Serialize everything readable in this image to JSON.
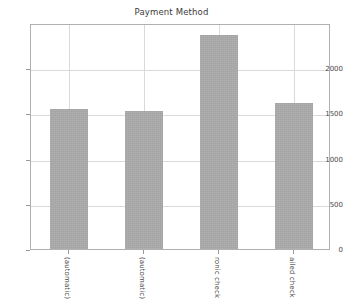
{
  "chart_data": {
    "type": "bar",
    "title": "Payment Method",
    "xlabel": "",
    "ylabel": "",
    "categories": [
      "(automatic)",
      "(automatic)",
      "ronic check",
      "ailed check"
    ],
    "values": [
      1544,
      1522,
      2365,
      1612
    ],
    "ylim": [
      0,
      2500
    ],
    "yticks": [
      0,
      500,
      1000,
      1500,
      2000
    ],
    "ytick_labels": [
      "0",
      "500",
      "1000",
      "1500",
      "2000"
    ],
    "grid": true,
    "legend": "none",
    "bar_color": "#a9a9a9",
    "axis_color": "#b0b0b0",
    "grid_color": "#d9d9d9",
    "text_color": "#4a4a4a",
    "background": "#ffffff"
  }
}
